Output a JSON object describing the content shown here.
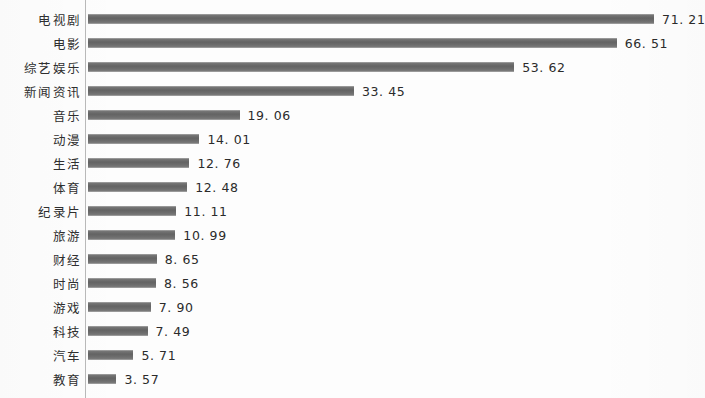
{
  "chart_data": {
    "type": "bar",
    "orientation": "horizontal",
    "title": "",
    "subtitle": "",
    "xlabel": "",
    "ylabel": "",
    "grid": false,
    "legend": false,
    "xlim": [
      0,
      75
    ],
    "axis_line": "category axis on left",
    "value_label_format": "two decimals",
    "bar_color": "#6e6e6e",
    "text_color": "#2b2b2b",
    "background": "#fdfdfd",
    "categories": [
      "电视剧",
      "电影",
      "综艺娱乐",
      "新闻资讯",
      "音乐",
      "动漫",
      "生活",
      "体育",
      "纪录片",
      "旅游",
      "财经",
      "时尚",
      "游戏",
      "科技",
      "汽车",
      "教育",
      "其他"
    ],
    "values": [
      71.21,
      66.51,
      53.62,
      33.45,
      19.06,
      14.01,
      12.76,
      12.48,
      11.11,
      10.99,
      8.65,
      8.56,
      7.9,
      7.49,
      5.71,
      3.57,
      5.68
    ],
    "value_labels": [
      "71. 21",
      "66. 51",
      "53. 62",
      "33. 45",
      "19. 06",
      "14. 01",
      "12. 76",
      "12. 48",
      "11. 11",
      "10. 99",
      "8. 65",
      "8. 56",
      "7. 90",
      "7. 49",
      "5. 71",
      "3. 57",
      "5. 68"
    ]
  },
  "layout": {
    "bar_origin_x": 88,
    "px_per_unit": 7.95,
    "row_height": 24,
    "first_row_top": 7,
    "label_gap": 8
  }
}
